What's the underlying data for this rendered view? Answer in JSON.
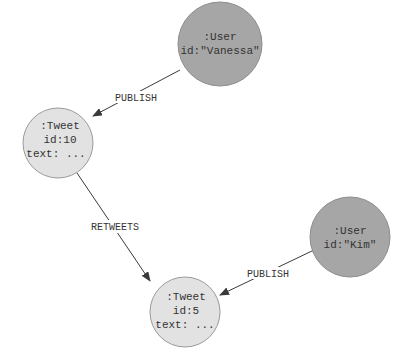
{
  "diagram": {
    "nodes": [
      {
        "id": "vanessa",
        "label": ":User",
        "lines": [
          ":User",
          "id:\"Vanessa\""
        ],
        "kind": "user"
      },
      {
        "id": "tweet10",
        "label": ":Tweet",
        "lines": [
          ":Tweet",
          "id:10",
          "text: ..."
        ],
        "kind": "tweet"
      },
      {
        "id": "kim",
        "label": ":User",
        "lines": [
          ":User",
          "id:\"Kim\""
        ],
        "kind": "user"
      },
      {
        "id": "tweet5",
        "label": ":Tweet",
        "lines": [
          ":Tweet",
          "id:5",
          "text: ..."
        ],
        "kind": "tweet"
      }
    ],
    "edges": [
      {
        "from": "vanessa",
        "to": "tweet10",
        "label": "PUBLISH"
      },
      {
        "from": "tweet10",
        "to": "tweet5",
        "label": "RETWEETS"
      },
      {
        "from": "kim",
        "to": "tweet5",
        "label": "PUBLISH"
      }
    ],
    "colors": {
      "user_fill": "#a6a6a6",
      "tweet_fill": "#e2e2e2",
      "edge": "#3a3a3a"
    }
  }
}
